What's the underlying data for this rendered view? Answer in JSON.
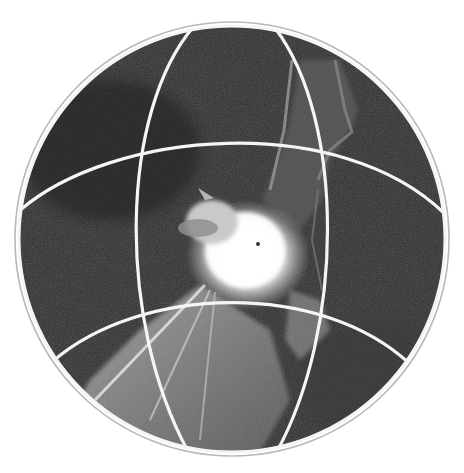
{
  "image": {
    "alt": "Black-and-white photograph of a bat in flight inside a circular globe with white latitude/longitude grid lines",
    "subject": "bat",
    "style": "monochrome photograph",
    "frame": "globe",
    "colors": {
      "background": "#ffffff",
      "photo_dark": "#2a2a2a",
      "photo_mid": "#555555",
      "grid_line": "#f5f5f5",
      "outer_ring": "#b8b8b8"
    }
  }
}
